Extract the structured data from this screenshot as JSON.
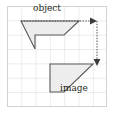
{
  "figure": {
    "background_color": "#ffffff",
    "frame": {
      "x": 7,
      "y": 6,
      "width": 100,
      "height": 101,
      "border_color": "#d9d9d9"
    },
    "grid": {
      "cell_size": 14.3,
      "line_color": "#d6d6d6",
      "columns": 7,
      "rows": 7,
      "visible": true
    },
    "labels": {
      "object": "object",
      "image": "image"
    },
    "shapes": [
      {
        "name": "object",
        "fill": "#eeeeee",
        "stroke": "#58585a",
        "stroke_width": 1.1,
        "points": "21,21 79,21 64,35 35,35 35,49"
      },
      {
        "name": "image",
        "fill": "#eeeeee",
        "stroke": "#58585a",
        "stroke_width": 1.1,
        "points": "50,92 50,64 93,64 93,64 64,92"
      }
    ],
    "arrows": [
      {
        "name": "horizontal-transfer-arrow",
        "style": "dotted",
        "color": "#4a4a4a",
        "from": [
          21,
          21
        ],
        "to": [
          96,
          21
        ],
        "head": "right"
      },
      {
        "name": "vertical-transfer-arrow",
        "style": "dotted",
        "color": "#4a4a4a",
        "from": [
          96,
          21
        ],
        "to": [
          96,
          64
        ],
        "head": "down"
      }
    ]
  }
}
